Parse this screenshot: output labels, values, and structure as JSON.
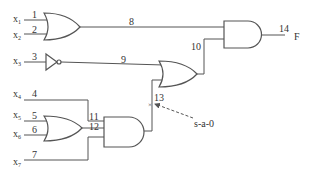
{
  "diagram": {
    "type": "logic-circuit",
    "inputs": [
      {
        "name": "x",
        "sub": "1",
        "wire": "1"
      },
      {
        "name": "x",
        "sub": "2",
        "wire": "2"
      },
      {
        "name": "x",
        "sub": "3",
        "wire": "3"
      },
      {
        "name": "x",
        "sub": "4",
        "wire": "4"
      },
      {
        "name": "x",
        "sub": "5",
        "wire": "5"
      },
      {
        "name": "x",
        "sub": "6",
        "wire": "6"
      },
      {
        "name": "x",
        "sub": "7",
        "wire": "7"
      }
    ],
    "wire_labels": {
      "w8": "8",
      "w9": "9",
      "w10": "10",
      "w11": "11",
      "w12": "12",
      "w13": "13",
      "w14": "14"
    },
    "output": {
      "name": "F"
    },
    "fault": {
      "label": "s-a-0",
      "wire": "13"
    },
    "gates": [
      {
        "id": "or1",
        "type": "OR",
        "inputs": [
          "1",
          "2"
        ],
        "output": "8"
      },
      {
        "id": "not1",
        "type": "NOT",
        "inputs": [
          "3"
        ],
        "output": "9"
      },
      {
        "id": "or3",
        "type": "OR",
        "inputs": [
          "5",
          "6"
        ],
        "output": "12"
      },
      {
        "id": "and2",
        "type": "AND",
        "inputs": [
          "11",
          "12",
          "7"
        ],
        "output": "13"
      },
      {
        "id": "or2",
        "type": "OR",
        "inputs": [
          "9",
          "13"
        ],
        "output": "10"
      },
      {
        "id": "and1",
        "type": "AND",
        "inputs": [
          "8",
          "10"
        ],
        "output": "14"
      }
    ]
  }
}
